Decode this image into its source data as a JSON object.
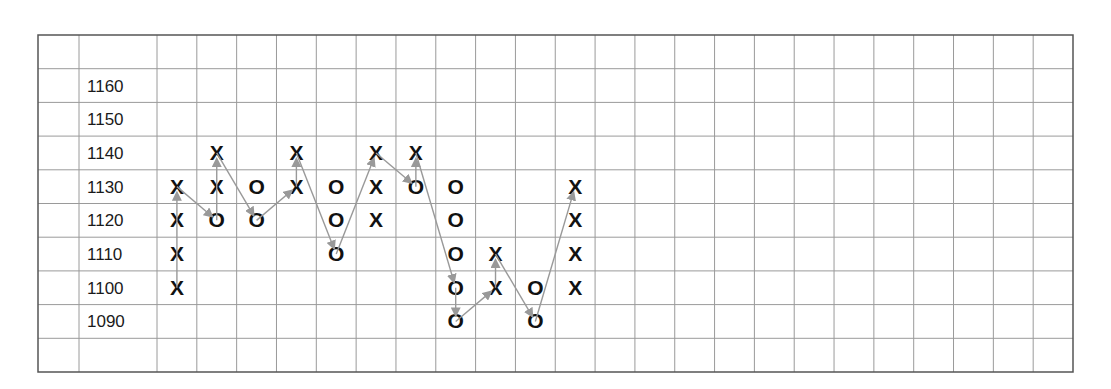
{
  "chart_data": {
    "type": "point-and-figure",
    "title": "",
    "box_size": 10,
    "price_levels": [
      1160,
      1150,
      1140,
      1130,
      1120,
      1110,
      1100,
      1090
    ],
    "ylim": [
      1090,
      1160
    ],
    "grid": true,
    "num_data_columns": 23,
    "columns": [
      {
        "index": 0,
        "X": [
          1130,
          1120,
          1110,
          1100
        ],
        "O": []
      },
      {
        "index": 1,
        "X": [
          1140,
          1130
        ],
        "O": [
          1120
        ]
      },
      {
        "index": 2,
        "X": [],
        "O": [
          1130,
          1120
        ]
      },
      {
        "index": 3,
        "X": [
          1140,
          1130
        ],
        "O": []
      },
      {
        "index": 4,
        "X": [],
        "O": [
          1130,
          1120,
          1110
        ]
      },
      {
        "index": 5,
        "X": [
          1140,
          1130,
          1120
        ],
        "O": []
      },
      {
        "index": 6,
        "X": [
          1140
        ],
        "O": [
          1130
        ]
      },
      {
        "index": 7,
        "X": [],
        "O": [
          1130,
          1120,
          1110,
          1100,
          1090
        ]
      },
      {
        "index": 8,
        "X": [
          1110,
          1100
        ],
        "O": []
      },
      {
        "index": 9,
        "X": [],
        "O": [
          1100,
          1090
        ]
      },
      {
        "index": 10,
        "X": [
          1130,
          1120,
          1110,
          1100
        ],
        "O": []
      }
    ],
    "arrow_path": [
      [
        0,
        1100
      ],
      [
        0,
        1130
      ],
      [
        1,
        1120
      ],
      [
        1,
        1140
      ],
      [
        2,
        1120
      ],
      [
        3,
        1130
      ],
      [
        3,
        1140
      ],
      [
        4,
        1110
      ],
      [
        5,
        1140
      ],
      [
        6,
        1130
      ],
      [
        6,
        1140
      ],
      [
        7,
        1100
      ],
      [
        7,
        1090
      ],
      [
        8,
        1100
      ],
      [
        8,
        1110
      ],
      [
        9,
        1090
      ],
      [
        10,
        1130
      ]
    ],
    "colors": {
      "grid": "#9a9a9a",
      "border": "#555555",
      "symbol": "#111111",
      "arrow": "#999999"
    },
    "layout": {
      "left": 38,
      "top": 35,
      "right": 1073,
      "bottom": 372,
      "gutter_col_width": 41,
      "label_col_width": 78,
      "row_height": 33.7,
      "data_col_width": 39.8,
      "rows": 10
    }
  }
}
